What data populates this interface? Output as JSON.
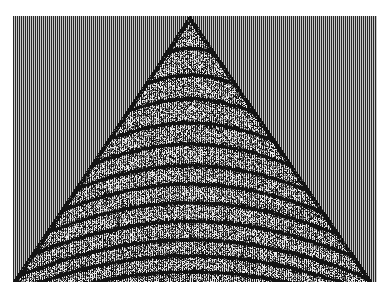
{
  "chart_data": {
    "type": "heatmap",
    "subtype": "seismic-shot-gather-wiggle",
    "title": "",
    "xlabel": "",
    "ylabel": "",
    "grid": false,
    "legend": null,
    "plot_area": {
      "x": 13,
      "y": 16,
      "width": 364,
      "height": 266
    },
    "traces": 182,
    "samples": 266,
    "apex": {
      "x_fraction": 0.485,
      "y_fraction": 0.0
    },
    "first_break_edges": {
      "left_bottom_x_fraction": 0.0,
      "right_bottom_x_fraction": 0.985
    },
    "colors": {
      "positive": "#000000",
      "negative": "#ffffff",
      "background_trace": "#8a8a8a"
    },
    "reflection_hyperbolas": [
      0.12,
      0.22,
      0.31,
      0.4,
      0.48,
      0.56,
      0.63,
      0.7,
      0.77,
      0.84,
      0.9,
      0.96
    ],
    "noise_level": 0.55
  }
}
